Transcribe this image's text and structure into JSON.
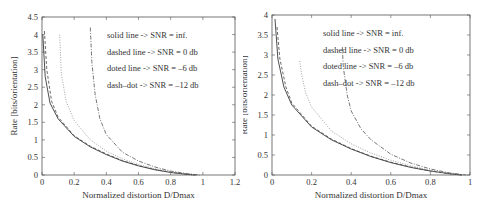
{
  "chart_data": [
    {
      "type": "line",
      "title": "",
      "xlabel": "Normalized distortion D/Dmax",
      "ylabel": "Rate [bits/orientation]",
      "xlim": [
        0,
        1.2
      ],
      "ylim": [
        0,
        4.5
      ],
      "xticks": [
        "0",
        "0.2",
        "0.4",
        "0.6",
        "0.8",
        "1",
        "1.2"
      ],
      "yticks": [
        "0",
        "0.5",
        "1",
        "1.5",
        "2",
        "2.5",
        "3",
        "3.5",
        "4",
        "4.5"
      ],
      "grid": false,
      "annotations": [
        "solid line -> SNR = inf.",
        "dashed line -> SNR = 0 db",
        "doted line -> SNR = –6 db",
        "dash–dot -> SNR = –12 db"
      ],
      "series": [
        {
          "name": "SNR = inf.",
          "style": "solid",
          "x": [
            0.005,
            0.02,
            0.05,
            0.1,
            0.2,
            0.3,
            0.4,
            0.5,
            0.6,
            0.7,
            0.8,
            0.9,
            0.95
          ],
          "y": [
            4.0,
            2.8,
            2.05,
            1.6,
            1.1,
            0.8,
            0.58,
            0.4,
            0.26,
            0.15,
            0.07,
            0.02,
            0.0
          ]
        },
        {
          "name": "SNR = 0 db",
          "style": "dashed",
          "x": [
            0.015,
            0.03,
            0.06,
            0.1,
            0.2,
            0.3,
            0.4,
            0.5,
            0.6,
            0.7,
            0.8,
            0.9,
            0.96
          ],
          "y": [
            4.1,
            3.0,
            2.1,
            1.65,
            1.12,
            0.82,
            0.6,
            0.41,
            0.27,
            0.16,
            0.08,
            0.02,
            0.0
          ]
        },
        {
          "name": "SNR = -6 db",
          "style": "dotted",
          "x": [
            0.11,
            0.12,
            0.15,
            0.2,
            0.3,
            0.4,
            0.5,
            0.6,
            0.7,
            0.8,
            0.9,
            0.97
          ],
          "y": [
            4.0,
            2.9,
            2.1,
            1.55,
            1.0,
            0.68,
            0.46,
            0.3,
            0.18,
            0.09,
            0.03,
            0.0
          ]
        },
        {
          "name": "SNR = -12 db",
          "style": "dash-dot",
          "x": [
            0.3,
            0.31,
            0.33,
            0.36,
            0.4,
            0.5,
            0.6,
            0.7,
            0.8,
            0.9,
            0.98
          ],
          "y": [
            4.2,
            3.2,
            2.3,
            1.6,
            1.15,
            0.65,
            0.4,
            0.23,
            0.11,
            0.04,
            0.0
          ]
        }
      ]
    },
    {
      "type": "line",
      "title": "",
      "xlabel": "Normalized distortion D/Dmax",
      "ylabel": "Rate [bits/orientation]",
      "xlim": [
        0,
        1
      ],
      "ylim": [
        0,
        4
      ],
      "xticks": [
        "0",
        "0.2",
        "0.4",
        "0.6",
        "0.8",
        "1"
      ],
      "yticks": [
        "0",
        "0.5",
        "1",
        "1.5",
        "2",
        "2.5",
        "3",
        "3.5",
        "4"
      ],
      "grid": false,
      "annotations": [
        "solid line -> SNR = inf.",
        "dashed line -> SNR = 0 db",
        "doted line -> SNR = –6 db",
        "dash–dot -> SNR = –12 db"
      ],
      "series": [
        {
          "name": "SNR = inf.",
          "style": "solid",
          "x": [
            0.015,
            0.03,
            0.06,
            0.1,
            0.2,
            0.3,
            0.4,
            0.5,
            0.6,
            0.7,
            0.8,
            0.9,
            0.96
          ],
          "y": [
            3.9,
            2.9,
            2.2,
            1.75,
            1.2,
            0.88,
            0.65,
            0.46,
            0.31,
            0.19,
            0.1,
            0.03,
            0.0
          ]
        },
        {
          "name": "SNR = 0 db",
          "style": "dashed",
          "x": [
            0.025,
            0.04,
            0.07,
            0.1,
            0.2,
            0.3,
            0.4,
            0.5,
            0.6,
            0.7,
            0.8,
            0.9,
            0.96
          ],
          "y": [
            3.7,
            2.9,
            2.2,
            1.8,
            1.22,
            0.9,
            0.66,
            0.47,
            0.32,
            0.2,
            0.1,
            0.03,
            0.0
          ]
        },
        {
          "name": "SNR = -6 db",
          "style": "dotted",
          "x": [
            0.14,
            0.15,
            0.17,
            0.2,
            0.3,
            0.4,
            0.5,
            0.6,
            0.7,
            0.8,
            0.9,
            0.97
          ],
          "y": [
            2.85,
            2.5,
            2.05,
            1.7,
            1.1,
            0.78,
            0.55,
            0.37,
            0.23,
            0.12,
            0.04,
            0.0
          ]
        },
        {
          "name": "SNR = -12 db",
          "style": "dash-dot",
          "x": [
            0.355,
            0.36,
            0.38,
            0.4,
            0.45,
            0.5,
            0.6,
            0.7,
            0.8,
            0.9,
            0.98
          ],
          "y": [
            3.2,
            2.7,
            2.0,
            1.6,
            1.15,
            0.88,
            0.52,
            0.3,
            0.15,
            0.05,
            0.0
          ]
        }
      ]
    }
  ]
}
